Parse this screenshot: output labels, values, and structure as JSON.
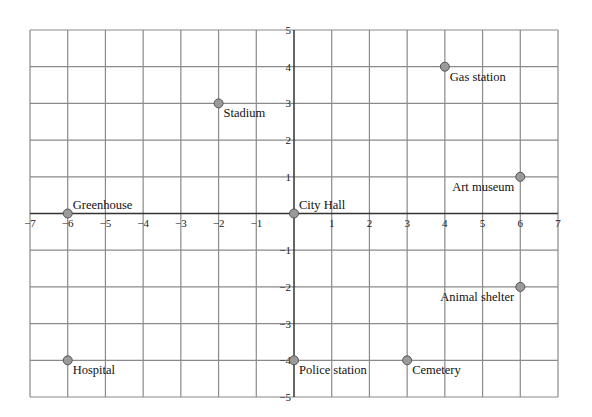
{
  "chart_data": {
    "type": "scatter",
    "title": "",
    "xlabel": "",
    "ylabel": "",
    "xlim": [
      -7,
      7
    ],
    "ylim": [
      -5,
      5
    ],
    "grid": true,
    "legend": null,
    "x_ticks": [
      -7,
      -6,
      -5,
      -4,
      -3,
      -2,
      -1,
      1,
      2,
      3,
      4,
      5,
      6,
      7
    ],
    "y_ticks": [
      -5,
      -4,
      -3,
      -2,
      -1,
      1,
      2,
      3,
      4,
      5
    ],
    "x_tick_labels": [
      "−7",
      "−6",
      "−5",
      "−4",
      "−3",
      "−2",
      "−1",
      "1",
      "2",
      "3",
      "4",
      "5",
      "6",
      "7"
    ],
    "y_tick_labels": [
      "−5",
      "−4",
      "−3",
      "−2",
      "−1",
      "1",
      "2",
      "3",
      "4",
      "5"
    ],
    "points": [
      {
        "label": "Stadium",
        "x": -2,
        "y": 3
      },
      {
        "label": "Gas station",
        "x": 4,
        "y": 4
      },
      {
        "label": "Art museum",
        "x": 6,
        "y": 1
      },
      {
        "label": "Greenhouse",
        "x": -6,
        "y": 0
      },
      {
        "label": "City Hall",
        "x": 0,
        "y": 0
      },
      {
        "label": "Animal shelter",
        "x": 6,
        "y": -2
      },
      {
        "label": "Hospital",
        "x": -6,
        "y": -4
      },
      {
        "label": "Police station",
        "x": 0,
        "y": -4
      },
      {
        "label": "Cemetery",
        "x": 3,
        "y": -4
      }
    ],
    "label_placement": {
      "Stadium": "below-right",
      "Gas station": "below-right",
      "Art museum": "below-left",
      "Greenhouse": "above-right",
      "City Hall": "above-right",
      "Animal shelter": "below-left",
      "Hospital": "below-right",
      "Police station": "below-right",
      "Cemetery": "below-right"
    }
  },
  "colors": {
    "grid": "#8a8a8a",
    "axis": "#333333",
    "point_fill": "#9a9a9a",
    "point_stroke": "#555555",
    "text": "#111111"
  }
}
